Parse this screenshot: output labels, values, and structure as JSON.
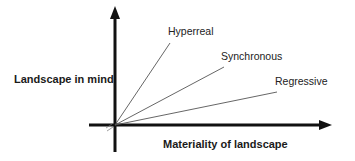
{
  "diagram": {
    "y_axis": {
      "label": "Landscape in mind"
    },
    "x_axis": {
      "label": "Materiality of landscape"
    },
    "rays": [
      {
        "label": "Hyperreal"
      },
      {
        "label": "Synchronous"
      },
      {
        "label": "Regressive"
      }
    ],
    "colors": {
      "axis": "#111111",
      "ray": "#555555",
      "text": "#1a1a1a"
    }
  }
}
